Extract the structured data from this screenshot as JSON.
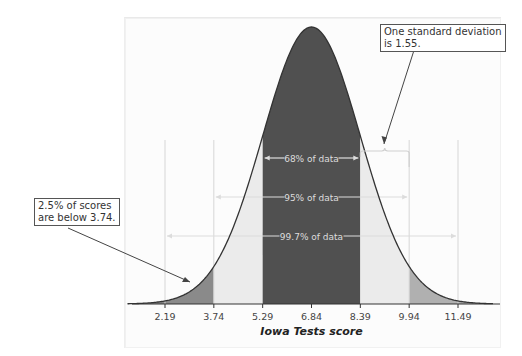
{
  "chart_data": {
    "type": "area",
    "title": "",
    "xlabel": "Iowa Tests score",
    "ylabel": "",
    "mean": 6.84,
    "standard_deviation": 1.55,
    "x_ticks": [
      2.19,
      3.74,
      5.29,
      6.84,
      8.39,
      9.94,
      11.49
    ],
    "x_tick_labels": [
      "2.19",
      "3.74",
      "5.29",
      "6.84",
      "8.39",
      "9.94",
      "11.49"
    ],
    "xlim": [
      1.0,
      12.6
    ],
    "grid": "vertical lines at ±2σ and ±3σ",
    "shaded_regions": [
      {
        "name": "lower 2.5% tail",
        "from": null,
        "to": 3.74,
        "color": "#8a8a8a"
      },
      {
        "name": "between -2σ and -1σ",
        "from": 3.74,
        "to": 5.29,
        "color": "#ebebeb"
      },
      {
        "name": "within 1σ (68%)",
        "from": 5.29,
        "to": 8.39,
        "color": "#505050"
      },
      {
        "name": "between +1σ and +2σ",
        "from": 8.39,
        "to": 9.94,
        "color": "#ebebeb"
      },
      {
        "name": "upper 2.5% tail",
        "from": 9.94,
        "to": null,
        "color": "#b0b0b0"
      }
    ],
    "ranges": [
      {
        "label": "68% of data",
        "from": 5.29,
        "to": 8.39
      },
      {
        "label": "95% of data",
        "from": 3.74,
        "to": 9.94
      },
      {
        "label": "99.7% of data",
        "from": 2.19,
        "to": 11.49
      }
    ],
    "annotations": [
      {
        "text": [
          "One standard deviation",
          "is 1.55."
        ],
        "points_to": "bracket from 8.39 to 9.94"
      },
      {
        "text": [
          "2.5% of scores",
          "are below 3.74."
        ],
        "points_to": "lower tail below 3.74"
      }
    ]
  },
  "labels": {
    "axis_title": "Iowa Tests score",
    "range_68": "68% of data",
    "range_95": "95% of data",
    "range_997": "99.7% of data"
  },
  "callouts": {
    "sd": {
      "line1": "One standard deviation",
      "line2": "is 1.55."
    },
    "tail": {
      "line1": "2.5% of scores",
      "line2": "are below 3.74."
    }
  },
  "colors": {
    "center": "#505050",
    "middle_bands": "#ebebeb",
    "left_tail": "#8a8a8a",
    "right_tail": "#b0b0b0",
    "curve": "#333333",
    "range_arrows": "#d8d8d8"
  }
}
